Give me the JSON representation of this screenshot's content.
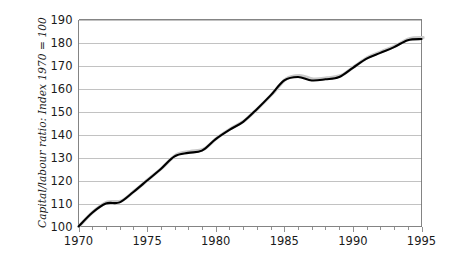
{
  "chart_data": {
    "type": "line",
    "title": "",
    "subtitle": "",
    "xlabel": "",
    "ylabel": "Capital/labour ratio: Index 1970 = 100",
    "xlim": [
      1970,
      1995
    ],
    "ylim": [
      100,
      190
    ],
    "ytick_step": 10,
    "xtick_step": 5,
    "minor_xtick_step": 1,
    "grid": "horizontal",
    "legend": "none",
    "y_ticks": [
      100,
      110,
      120,
      130,
      140,
      150,
      160,
      170,
      180,
      190
    ],
    "x_ticks": [
      1970,
      1975,
      1980,
      1985,
      1990,
      1995
    ],
    "x_minor_ticks": [
      1970,
      1971,
      1972,
      1973,
      1974,
      1975,
      1976,
      1977,
      1978,
      1979,
      1980,
      1981,
      1982,
      1983,
      1984,
      1985,
      1986,
      1987,
      1988,
      1989,
      1990,
      1991,
      1992,
      1993,
      1994,
      1995
    ],
    "x": [
      1970,
      1971,
      1972,
      1973,
      1974,
      1975,
      1976,
      1977,
      1978,
      1979,
      1980,
      1981,
      1982,
      1983,
      1984,
      1985,
      1986,
      1987,
      1988,
      1989,
      1990,
      1991,
      1992,
      1993,
      1994,
      1995
    ],
    "values": [
      100,
      106,
      110,
      110.5,
      115,
      120,
      125,
      130.5,
      132,
      133,
      138,
      142,
      145.5,
      151,
      157,
      163.5,
      165,
      163.5,
      164,
      165,
      169,
      173,
      175.5,
      178,
      181,
      181.5
    ],
    "series": [
      {
        "name": "Capital/labour ratio",
        "color": "#000000",
        "values": [
          100,
          106,
          110,
          110.5,
          115,
          120,
          125,
          130.5,
          132,
          133,
          138,
          142,
          145.5,
          151,
          157,
          163.5,
          165,
          163.5,
          164,
          165,
          169,
          173,
          175.5,
          178,
          181,
          181.5
        ]
      }
    ],
    "annotations": []
  },
  "style": {
    "line_color": "#000000",
    "shadow_color": "#c9c9c9",
    "grid_color": "#a8a8a8",
    "axis_color": "#777777",
    "text_color": "#1a1a1a",
    "background": "#ffffff"
  }
}
